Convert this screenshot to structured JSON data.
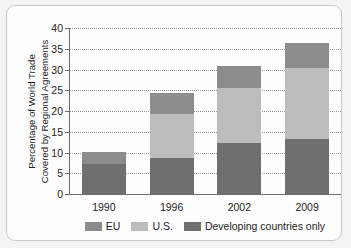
{
  "chart_data": {
    "type": "bar",
    "subtype": "stacked-bar",
    "title": "",
    "xlabel": "",
    "ylabel": "Percentage of World Trade Covered by Regional Agreements",
    "ylabel_line1": "Percentage of World Trade",
    "ylabel_line2": "Covered by Regional Agreements",
    "categories": [
      "1990",
      "1996",
      "2002",
      "2009"
    ],
    "ylim": [
      0,
      40
    ],
    "ytick_step": 5,
    "yticks": [
      "40",
      "35",
      "30",
      "25",
      "20",
      "15",
      "10",
      "5",
      "0"
    ],
    "grid": "horizontal-dotted",
    "legend_position": "bottom",
    "series": [
      {
        "name": "Developing countries only",
        "color": "#6f6f6f",
        "values": [
          7.2,
          8.7,
          12.4,
          13.3
        ]
      },
      {
        "name": "U.S.",
        "color": "#bcbcbc",
        "values": [
          0.0,
          10.6,
          13.1,
          17.0
        ]
      },
      {
        "name": "EU",
        "color": "#8c8c8c",
        "values": [
          2.9,
          5.1,
          5.4,
          6.2
        ]
      }
    ],
    "totals": [
      10.1,
      24.4,
      30.9,
      36.5
    ],
    "legend_order": [
      "EU",
      "U.S.",
      "Developing countries only"
    ]
  },
  "legend": {
    "items": [
      {
        "label": "EU",
        "color": "#8c8c8c"
      },
      {
        "label": "U.S.",
        "color": "#bcbcbc"
      },
      {
        "label": "Developing countries only",
        "color": "#6f6f6f"
      }
    ]
  },
  "colors": {
    "axis": "#6d6d6d",
    "grid": "#9a9a9a",
    "text": "#1d1d1d",
    "card": "#fdfdfd",
    "page": "#f4f4f4"
  }
}
